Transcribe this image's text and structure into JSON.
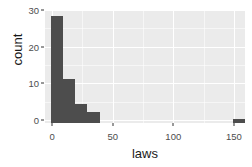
{
  "chart_data": {
    "type": "bar",
    "title": "",
    "subtitle": "",
    "xlabel": "laws",
    "ylabel": "count",
    "binwidth": 10,
    "grid": true,
    "legend": null,
    "xlim": [
      -5,
      160
    ],
    "ylim": [
      0,
      30.5
    ],
    "xticks": [
      0,
      50,
      100,
      150
    ],
    "xtick_labels": [
      "0",
      "50",
      "100",
      "150"
    ],
    "yticks": [
      0,
      10,
      20,
      30
    ],
    "ytick_labels": [
      "0",
      "10",
      "20",
      "30"
    ],
    "xminor": [
      25,
      75,
      125
    ],
    "yminor": [
      5,
      15,
      25
    ],
    "bins": [
      {
        "x_start": 0,
        "x_end": 10,
        "center": 5,
        "count": 29
      },
      {
        "x_start": 10,
        "x_end": 20,
        "center": 15,
        "count": 12
      },
      {
        "x_start": 20,
        "x_end": 30,
        "center": 25,
        "count": 5
      },
      {
        "x_start": 30,
        "x_end": 40,
        "center": 35,
        "count": 3
      },
      {
        "x_start": 150,
        "x_end": 160,
        "center": 155,
        "count": 1
      }
    ],
    "categories": [
      "0-10",
      "10-20",
      "20-30",
      "30-40",
      "150-160"
    ],
    "values": [
      29,
      12,
      5,
      3,
      1
    ],
    "colors": {
      "bar_fill": "#4d4d4d",
      "panel_background": "#ebebeb",
      "gridline": "#ffffff",
      "plot_background": "#ffffff",
      "axis_text": "#4d4d4d",
      "axis_title": "#1a1a1a"
    }
  },
  "axes": {
    "x_title": "laws",
    "y_title": "count"
  }
}
